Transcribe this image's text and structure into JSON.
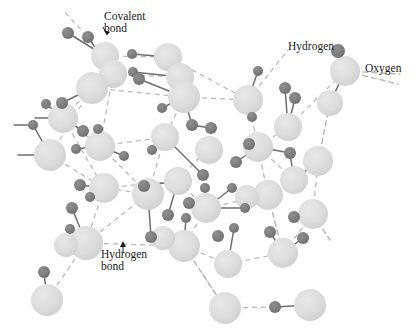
{
  "figure": {
    "background_color": "#ffffff",
    "oxygen_color": "#dcdcdc",
    "hydrogen_color": "#7d7d7d",
    "covalent_bond_color": "#6e6e6e",
    "hydrogen_bond_color": "#b9b9b9",
    "label_color": "#1a1a1a"
  },
  "labels": {
    "covalent_bond_line1": "Covalent",
    "covalent_bond_line2": "bond",
    "hydrogen": "Hydrogen",
    "oxygen": "Oxygen",
    "hydrogen_bond_line1": "Hydrogen",
    "hydrogen_bond_line2": "bond"
  },
  "legend_targets": {
    "covalent_bond_points_to": "covalent-bond-segment",
    "hydrogen_points_to": "hydrogen-atom-callout",
    "oxygen_points_to": "oxygen-atom-callout",
    "hydrogen_bond_points_to": "hydrogen-bond-segment"
  },
  "atoms": {
    "oxygen_radius": 14,
    "hydrogen_radius": 6,
    "oxygen": [
      [
        105,
        56
      ],
      [
        113,
        74
      ],
      [
        92,
        88
      ],
      [
        63,
        118
      ],
      [
        50,
        155
      ],
      [
        100,
        146
      ],
      [
        104,
        188
      ],
      [
        86,
        243
      ],
      [
        47,
        300
      ],
      [
        168,
        57
      ],
      [
        180,
        77
      ],
      [
        184,
        97
      ],
      [
        165,
        137
      ],
      [
        178,
        181
      ],
      [
        148,
        194
      ],
      [
        225,
        308
      ],
      [
        184,
        246
      ],
      [
        228,
        264
      ],
      [
        206,
        208
      ],
      [
        248,
        100
      ],
      [
        258,
        147
      ],
      [
        268,
        195
      ],
      [
        294,
        180
      ],
      [
        283,
        253
      ],
      [
        310,
        305
      ],
      [
        288,
        127
      ],
      [
        318,
        161
      ],
      [
        313,
        214
      ],
      [
        345,
        71
      ],
      [
        330,
        103
      ]
    ],
    "hydrogen": [
      [
        68,
        33
      ],
      [
        88,
        37
      ],
      [
        132,
        54
      ],
      [
        133,
        72
      ],
      [
        139,
        79
      ],
      [
        46,
        104
      ],
      [
        33,
        125
      ],
      [
        62,
        103
      ],
      [
        83,
        131
      ],
      [
        98,
        129
      ],
      [
        76,
        149
      ],
      [
        80,
        185
      ],
      [
        90,
        197
      ],
      [
        72,
        208
      ],
      [
        70,
        229
      ],
      [
        44,
        272
      ],
      [
        124,
        156
      ],
      [
        152,
        150
      ],
      [
        144,
        186
      ],
      [
        151,
        237
      ],
      [
        168,
        215
      ],
      [
        186,
        218
      ],
      [
        192,
        125
      ],
      [
        211,
        128
      ],
      [
        203,
        175
      ],
      [
        232,
        188
      ],
      [
        236,
        162
      ],
      [
        245,
        208
      ],
      [
        252,
        117
      ],
      [
        258,
        71
      ],
      [
        275,
        307
      ],
      [
        290,
        153
      ],
      [
        295,
        98
      ],
      [
        303,
        238
      ],
      [
        338,
        51
      ],
      [
        294,
        217
      ],
      [
        270,
        232
      ],
      [
        285,
        88
      ],
      [
        162,
        108
      ],
      [
        189,
        203
      ],
      [
        234,
        228
      ],
      [
        249,
        144
      ]
    ]
  },
  "structure": {
    "description": "Hexagonal ice lattice: large light spheres are oxygen atoms, small dark spheres are hydrogen atoms; solid lines are covalent bonds, dashed lines are hydrogen bonds."
  }
}
